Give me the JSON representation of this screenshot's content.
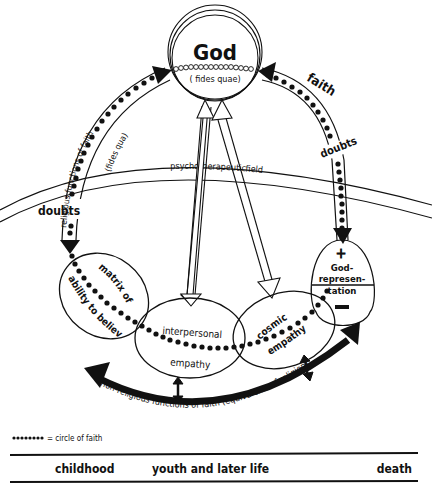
{
  "diagram": {
    "god": {
      "title": "God",
      "subtitle": "( fides quae)"
    },
    "left_arc": {
      "label_outer": "religious functions of faith",
      "label_inner": "(fides qua)",
      "doubts": "doubts"
    },
    "right_arc": {
      "faith": "faith",
      "doubts": "doubts"
    },
    "field": {
      "left": "psychotherapeutic",
      "right": "field"
    },
    "god_representation": {
      "plus": "+",
      "line1": "God-",
      "line2": "represen-",
      "line3": "tation",
      "minus": "−"
    },
    "ellipses": {
      "matrix_line1": "matrix of",
      "matrix_line2": "ability to believe",
      "interpersonal_line1": "interpersonal",
      "interpersonal_line2": "empathy",
      "cosmic_line1": "cosmic",
      "cosmic_line2": "empathy"
    },
    "bottom_arc_label": "non-religious functions of faith  (equivalents of religion)",
    "legend": {
      "symbol": "●●●●●●●●",
      "label": "= circle of faith"
    },
    "timeline": {
      "childhood": "childhood",
      "youth": "youth  and later life",
      "death": "death"
    }
  }
}
